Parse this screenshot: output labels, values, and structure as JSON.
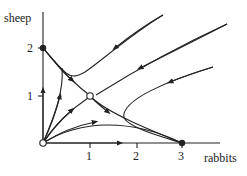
{
  "diagram": {
    "type": "phase-portrait",
    "axes": {
      "x_label": "rabbits",
      "y_label": "sheep",
      "x_ticks": [
        "1",
        "2",
        "3"
      ],
      "y_ticks": [
        "1",
        "2"
      ]
    },
    "fixed_points": [
      {
        "name": "origin",
        "coords": [
          0,
          0
        ],
        "style": "open",
        "type": "unstable node"
      },
      {
        "name": "sheep-only",
        "coords": [
          0,
          2
        ],
        "style": "filled",
        "type": "stable node"
      },
      {
        "name": "coexistence",
        "coords": [
          1,
          1
        ],
        "style": "open",
        "type": "saddle"
      },
      {
        "name": "rabbits-only",
        "coords": [
          3,
          0
        ],
        "style": "filled",
        "type": "stable node"
      }
    ],
    "colors": {
      "stroke": "#222222",
      "background": "#ffffff"
    }
  }
}
